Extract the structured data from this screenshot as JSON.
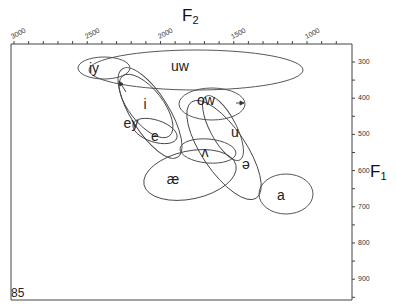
{
  "chart_data": {
    "type": "scatter",
    "title": "",
    "subtitle": "F1 vs F2 vowel formant ellipses",
    "xlabel": "F2",
    "ylabel": "F1",
    "x_axis_position": "top",
    "y_axis_position": "right",
    "x_reversed": true,
    "y_reversed": true,
    "xlim": [
      3100,
      700
    ],
    "ylim": [
      250,
      950
    ],
    "x_ticks": [
      3000,
      2500,
      2000,
      1500,
      1000
    ],
    "x_minor_step": 100,
    "y_ticks": [
      300,
      400,
      500,
      600,
      700,
      800,
      900
    ],
    "grid": false,
    "legend": "none",
    "figure_number": "85",
    "series": [
      {
        "name": "iy",
        "label_x": 2680,
        "label_y": 320,
        "cx": 2670,
        "cy": 320,
        "rx": 190,
        "ry": 30,
        "angle": 0
      },
      {
        "name": "uw",
        "label_x": 1930,
        "label_y": 320,
        "cx": 1920,
        "cy": 330,
        "rx": 820,
        "ry": 55,
        "angle": 0
      },
      {
        "name": "i",
        "label_x": 2230,
        "label_y": 415,
        "cx": 2220,
        "cy": 440,
        "rx": 250,
        "ry": 100,
        "angle": 50
      },
      {
        "name": "ey",
        "label_x": 2320,
        "label_y": 470,
        "cx": 2150,
        "cy": 465,
        "rx": 330,
        "ry": 100,
        "angle": 58
      },
      {
        "name": "e",
        "label_x": 2150,
        "label_y": 510,
        "cx": 2120,
        "cy": 505,
        "rx": 170,
        "ry": 35,
        "angle": 15
      },
      {
        "name": "ow",
        "label_x": 1750,
        "label_y": 400,
        "cx": 1640,
        "cy": 410,
        "rx": 230,
        "ry": 45,
        "angle": 0
      },
      {
        "name": "u",
        "label_x": 1510,
        "label_y": 490,
        "cx": 1480,
        "cy": 480,
        "rx": 260,
        "ry": 55,
        "angle": 60
      },
      {
        "name": "ʌ",
        "label_x": 1800,
        "label_y": 570,
        "cx": 1790,
        "cy": 560,
        "rx": 190,
        "ry": 35,
        "angle": 5
      },
      {
        "name": "ə",
        "label_x": 1550,
        "label_y": 610,
        "cx": 1650,
        "cy": 555,
        "rx": 400,
        "ry": 95,
        "angle": 55
      },
      {
        "name": "æ",
        "label_x": 2000,
        "label_y": 630,
        "cx": 1980,
        "cy": 630,
        "rx": 360,
        "ry": 65,
        "angle": -12
      },
      {
        "name": "a",
        "label_x": 1200,
        "label_y": 685,
        "cx": 1180,
        "cy": 680,
        "rx": 190,
        "ry": 55,
        "angle": 0
      }
    ]
  },
  "axes": {
    "x_title": "F",
    "x_title_sub": "2",
    "y_title": "F",
    "y_title_sub": "1",
    "x_tick_labels": [
      "3000",
      "2500",
      "2000",
      "1500",
      "1000"
    ],
    "y_tick_labels": [
      "300",
      "400",
      "500",
      "600",
      "700",
      "800",
      "900"
    ]
  },
  "vowels": {
    "iy": "iy",
    "uw": "uw",
    "i": "i",
    "ey": "ey",
    "e": "e",
    "ow": "ow",
    "u": "u",
    "wedge": "ʌ",
    "schwa": "ə",
    "ae": "æ",
    "a": "a"
  },
  "figure_number": "85",
  "colors": {
    "line": "#444444",
    "text": "#222222",
    "background": "#ffffff"
  }
}
